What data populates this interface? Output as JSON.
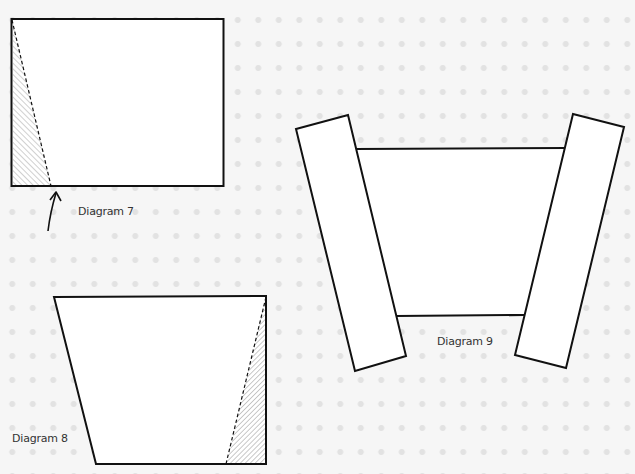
{
  "diagrams": [
    {
      "id": "diagram-7",
      "label": "Diagram 7",
      "description": "Rectangle with shaded triangle on left, dashed fold line, arrow pointing to fold point"
    },
    {
      "id": "diagram-8",
      "label": "Diagram 8",
      "description": "Trapezoid with shaded triangle on right and dashed fold line"
    },
    {
      "id": "diagram-9",
      "label": "Diagram 9",
      "description": "Trapezoid panel with two tilted rectangular strips on each side"
    }
  ],
  "colors": {
    "stroke": "#111111",
    "fill": "#ffffff",
    "hatch": "#666666",
    "background": "#f6f6f6",
    "label": "#333333"
  }
}
